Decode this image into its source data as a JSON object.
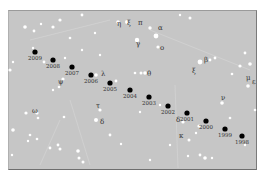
{
  "chart_data": {
    "type": "scatter",
    "title": "",
    "background_color": "#c6c6c6",
    "marker_color": "#000000",
    "star_color": "#ffffff",
    "path_points": [
      {
        "year": "2009",
        "x": 35,
        "y": 52
      },
      {
        "year": "2008",
        "x": 53,
        "y": 60
      },
      {
        "year": "2007",
        "x": 72,
        "y": 67
      },
      {
        "year": "2006",
        "x": 91,
        "y": 75
      },
      {
        "year": "2005",
        "x": 110,
        "y": 83
      },
      {
        "year": "2004",
        "x": 130,
        "y": 90
      },
      {
        "year": "2003",
        "x": 149,
        "y": 97
      },
      {
        "year": "2002",
        "x": 168,
        "y": 106
      },
      {
        "year": "2001",
        "x": 187,
        "y": 113
      },
      {
        "year": "2000",
        "x": 206,
        "y": 121
      },
      {
        "year": "1999",
        "x": 225,
        "y": 129
      },
      {
        "year": "1998",
        "x": 242,
        "y": 136
      }
    ],
    "star_labels": [
      {
        "label": "η",
        "x": 117,
        "y": 26
      },
      {
        "label": "ξ",
        "x": 127,
        "y": 25
      },
      {
        "label": "π",
        "x": 138,
        "y": 25
      },
      {
        "label": "α",
        "x": 158,
        "y": 30
      },
      {
        "label": "γ",
        "x": 136,
        "y": 46
      },
      {
        "label": "o",
        "x": 160,
        "y": 50
      },
      {
        "label": "λ",
        "x": 101,
        "y": 76
      },
      {
        "label": "ψ",
        "x": 58,
        "y": 84
      },
      {
        "label": "θ",
        "x": 147,
        "y": 76
      },
      {
        "label": "β",
        "x": 204,
        "y": 62
      },
      {
        "label": "ξ",
        "x": 192,
        "y": 73
      },
      {
        "label": "μ",
        "x": 246,
        "y": 80
      },
      {
        "label": "ε",
        "x": 252,
        "y": 84
      },
      {
        "label": "ν",
        "x": 221,
        "y": 100
      },
      {
        "label": "ω",
        "x": 32,
        "y": 113
      },
      {
        "label": "τ",
        "x": 96,
        "y": 108
      },
      {
        "label": "δ",
        "x": 100,
        "y": 124
      },
      {
        "label": "δ",
        "x": 176,
        "y": 122
      },
      {
        "label": "κ",
        "x": 179,
        "y": 138
      }
    ]
  }
}
